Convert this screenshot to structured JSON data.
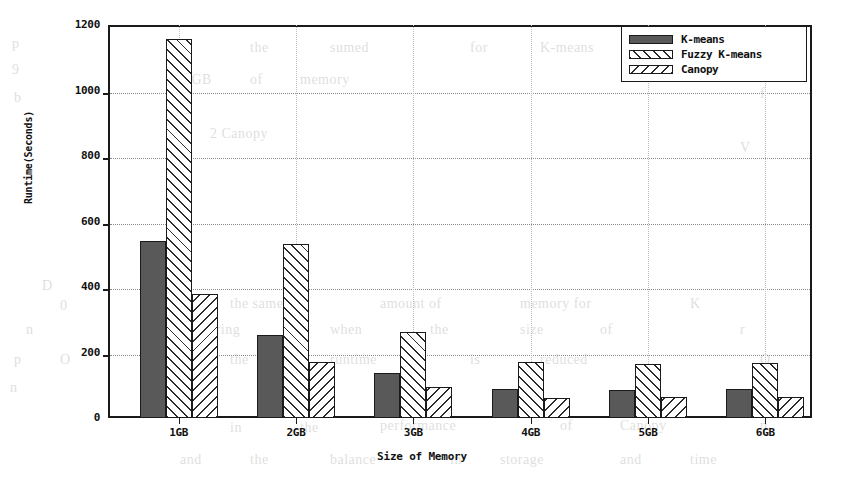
{
  "chart_data": {
    "type": "bar",
    "title": "",
    "xlabel": "Size of Memory",
    "ylabel": "Runtime(Seconds)",
    "categories": [
      "1GB",
      "2GB",
      "3GB",
      "4GB",
      "5GB",
      "6GB"
    ],
    "series": [
      {
        "name": "K-means",
        "fill": "solid-dark",
        "values": [
          540,
          255,
          138,
          88,
          85,
          90
        ]
      },
      {
        "name": "Fuzzy K-means",
        "fill": "diagonal-hatch-up",
        "values": [
          1158,
          532,
          263,
          170,
          165,
          168
        ]
      },
      {
        "name": "Canopy",
        "fill": "diagonal-hatch-down",
        "values": [
          380,
          172,
          95,
          62,
          63,
          65
        ]
      }
    ],
    "ylim": [
      0,
      1200
    ],
    "yticks": [
      0,
      200,
      400,
      600,
      800,
      1000,
      1200
    ],
    "ytick_labels": [
      "0",
      "200",
      "400",
      "600",
      "800",
      "1000",
      "1200"
    ],
    "grid": true,
    "grid_style": "dotted-horizontal",
    "legend_position": "top-right",
    "colors": {
      "axis": "#1a1a1a",
      "grid": "#8a8a8a",
      "kmeans_fill": "#595959",
      "hatch": "#2b2b2b",
      "background": "#ffffff"
    }
  },
  "legend": {
    "items": [
      {
        "label": "K-means"
      },
      {
        "label": "Fuzzy K-means"
      },
      {
        "label": "Canopy"
      }
    ]
  },
  "bleed_text": [
    {
      "t": "p",
      "x": 12,
      "y": 36
    },
    {
      "t": "9",
      "x": 12,
      "y": 62
    },
    {
      "t": "b",
      "x": 14,
      "y": 90
    },
    {
      "t": "the",
      "x": 250,
      "y": 40
    },
    {
      "t": "sumed",
      "x": 330,
      "y": 40
    },
    {
      "t": "for",
      "x": 470,
      "y": 40
    },
    {
      "t": "K-means",
      "x": 540,
      "y": 40
    },
    {
      "t": "h",
      "x": 690,
      "y": 34
    },
    {
      "t": "1 GB",
      "x": 180,
      "y": 72
    },
    {
      "t": "of",
      "x": 250,
      "y": 72
    },
    {
      "t": "memory",
      "x": 300,
      "y": 72
    },
    {
      "t": "f",
      "x": 760,
      "y": 86
    },
    {
      "t": "2 Canopy",
      "x": 210,
      "y": 126
    },
    {
      "t": "V",
      "x": 740,
      "y": 140
    },
    {
      "t": "D",
      "x": 42,
      "y": 278
    },
    {
      "t": "0",
      "x": 60,
      "y": 298
    },
    {
      "t": "the same",
      "x": 230,
      "y": 296
    },
    {
      "t": "amount of",
      "x": 380,
      "y": 296
    },
    {
      "t": "memory for",
      "x": 520,
      "y": 296
    },
    {
      "t": "K",
      "x": 690,
      "y": 296
    },
    {
      "t": "n",
      "x": 26,
      "y": 322
    },
    {
      "t": "clustering",
      "x": 180,
      "y": 322
    },
    {
      "t": "when",
      "x": 330,
      "y": 322
    },
    {
      "t": "the",
      "x": 430,
      "y": 322
    },
    {
      "t": "size",
      "x": 520,
      "y": 322
    },
    {
      "t": "of",
      "x": 600,
      "y": 322
    },
    {
      "t": "r",
      "x": 740,
      "y": 322
    },
    {
      "t": "p",
      "x": 14,
      "y": 352
    },
    {
      "t": "O",
      "x": 60,
      "y": 352
    },
    {
      "t": "the",
      "x": 230,
      "y": 352
    },
    {
      "t": "runtime",
      "x": 330,
      "y": 352
    },
    {
      "t": "is",
      "x": 470,
      "y": 352
    },
    {
      "t": "reduced",
      "x": 540,
      "y": 352
    },
    {
      "t": "O",
      "x": 760,
      "y": 352
    },
    {
      "t": "n",
      "x": 10,
      "y": 380
    },
    {
      "t": "in",
      "x": 230,
      "y": 420
    },
    {
      "t": "the",
      "x": 300,
      "y": 420
    },
    {
      "t": "performance",
      "x": 380,
      "y": 418
    },
    {
      "t": "of",
      "x": 560,
      "y": 418
    },
    {
      "t": "Canopy",
      "x": 620,
      "y": 418
    },
    {
      "t": "n",
      "x": 760,
      "y": 418
    },
    {
      "t": "and",
      "x": 180,
      "y": 452
    },
    {
      "t": "the",
      "x": 250,
      "y": 452
    },
    {
      "t": "balance",
      "x": 330,
      "y": 452
    },
    {
      "t": "in",
      "x": 450,
      "y": 452
    },
    {
      "t": "storage",
      "x": 500,
      "y": 452
    },
    {
      "t": "and",
      "x": 620,
      "y": 452
    },
    {
      "t": "time",
      "x": 690,
      "y": 452
    }
  ]
}
